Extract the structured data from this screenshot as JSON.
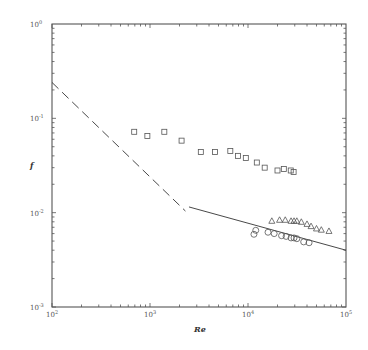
{
  "chart_data": {
    "type": "scatter",
    "title": "",
    "xlabel": "Re",
    "ylabel": "f",
    "xscale": "log",
    "yscale": "log",
    "xlim": [
      100,
      100000
    ],
    "ylim": [
      0.001,
      1
    ],
    "x_tick_labels": [
      "10^2",
      "10^3",
      "10^4",
      "10^5"
    ],
    "y_tick_labels": [
      "10^0",
      "10^-1",
      "10^-2",
      "10^-3"
    ],
    "grid": false,
    "legend": null,
    "series": [
      {
        "name": "squares",
        "marker": "square",
        "x": [
          690,
          940,
          1400,
          2100,
          3300,
          4600,
          6600,
          7900,
          9500,
          12300,
          14800,
          20000,
          23200,
          27300,
          29200
        ],
        "y": [
          0.072,
          0.065,
          0.072,
          0.058,
          0.044,
          0.044,
          0.045,
          0.04,
          0.038,
          0.034,
          0.03,
          0.028,
          0.029,
          0.028,
          0.027
        ]
      },
      {
        "name": "triangles",
        "marker": "triangle",
        "x": [
          17500,
          21000,
          24000,
          27500,
          29500,
          31500,
          35000,
          40000,
          44000,
          50000,
          56000,
          67000
        ],
        "y": [
          0.0082,
          0.0084,
          0.0084,
          0.0082,
          0.0082,
          0.0082,
          0.008,
          0.0076,
          0.0072,
          0.0068,
          0.0066,
          0.0064
        ]
      },
      {
        "name": "circles",
        "marker": "circle",
        "x": [
          11500,
          12000,
          16000,
          18500,
          22000,
          24500,
          27500,
          29500,
          31500,
          37000,
          42000
        ],
        "y": [
          0.0059,
          0.0065,
          0.0062,
          0.006,
          0.0057,
          0.0056,
          0.0054,
          0.0054,
          0.0053,
          0.0049,
          0.0048
        ]
      },
      {
        "name": "laminar (dashed)",
        "style": "dashed-line",
        "x": [
          100,
          2300
        ],
        "y": [
          0.24,
          0.0104
        ]
      },
      {
        "name": "turbulent (solid)",
        "style": "solid-line",
        "x": [
          2500,
          100000
        ],
        "y": [
          0.0115,
          0.004
        ]
      }
    ]
  },
  "axes": {
    "x_title": "Re",
    "y_title": "f",
    "x_ticks": [
      {
        "label": "10",
        "exp": "2"
      },
      {
        "label": "10",
        "exp": "3"
      },
      {
        "label": "10",
        "exp": "4"
      },
      {
        "label": "10",
        "exp": "5"
      }
    ],
    "y_ticks": [
      {
        "label": "10",
        "exp": "0"
      },
      {
        "label": "10",
        "exp": "-1"
      },
      {
        "label": "10",
        "exp": "-2"
      },
      {
        "label": "10",
        "exp": "-3"
      }
    ]
  },
  "colors": {
    "axis": "#555555",
    "marker": "#555555",
    "line": "#333333"
  }
}
